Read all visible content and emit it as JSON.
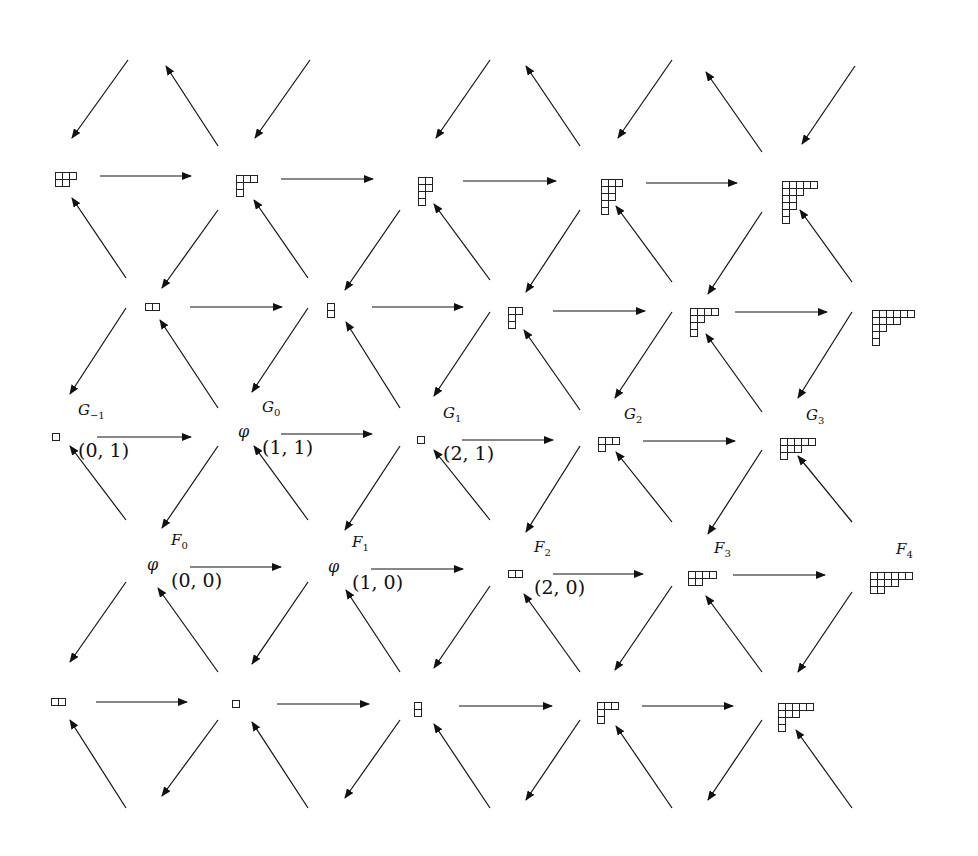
{
  "diagram": {
    "type": "young-diagram-lattice",
    "arrow_color": "#111111",
    "rows": [
      {
        "name": "row-1",
        "nodes": [
          {
            "x": 55,
            "y": 172,
            "partition": [
              3,
              2
            ]
          },
          {
            "x": 236,
            "y": 175,
            "partition": [
              3,
              1,
              1
            ]
          },
          {
            "x": 418,
            "y": 177,
            "partition": [
              2,
              2,
              1,
              1
            ]
          },
          {
            "x": 601,
            "y": 179,
            "partition": [
              3,
              2,
              2,
              1,
              1
            ]
          },
          {
            "x": 782,
            "y": 181,
            "partition": [
              5,
              3,
              2,
              2,
              1,
              1
            ]
          }
        ]
      },
      {
        "name": "row-2",
        "nodes": [
          {
            "x": 145,
            "y": 303,
            "partition": [
              2
            ]
          },
          {
            "x": 327,
            "y": 303,
            "partition": [
              1,
              1
            ]
          },
          {
            "x": 508,
            "y": 307,
            "partition": [
              2,
              1,
              1
            ]
          },
          {
            "x": 690,
            "y": 308,
            "partition": [
              4,
              2,
              1,
              1
            ]
          },
          {
            "x": 872,
            "y": 310,
            "partition": [
              6,
              4,
              2,
              1,
              1
            ]
          }
        ]
      },
      {
        "name": "row-G",
        "nodes": [
          {
            "x": 52,
            "y": 433,
            "partition": [
              1
            ],
            "label": "G",
            "sub": "−1",
            "coord": "(0, 1)"
          },
          {
            "x": 236,
            "y": 430,
            "partition": [],
            "label": "G",
            "sub": "0",
            "coord": "(1, 1)"
          },
          {
            "x": 417,
            "y": 436,
            "partition": [
              1
            ],
            "label": "G",
            "sub": "1",
            "coord": "(2, 1)"
          },
          {
            "x": 598,
            "y": 437,
            "partition": [
              3,
              1
            ],
            "label": "G",
            "sub": "2"
          },
          {
            "x": 780,
            "y": 438,
            "partition": [
              5,
              3,
              1
            ],
            "label": "G",
            "sub": "3"
          }
        ]
      },
      {
        "name": "row-F",
        "nodes": [
          {
            "x": 145,
            "y": 563,
            "partition": [],
            "label": "F",
            "sub": "0",
            "coord": "(0, 0)"
          },
          {
            "x": 326,
            "y": 565,
            "partition": [],
            "label": "F",
            "sub": "1",
            "coord": "(1, 0)"
          },
          {
            "x": 508,
            "y": 570,
            "partition": [
              2
            ],
            "label": "F",
            "sub": "2",
            "coord": "(2, 0)"
          },
          {
            "x": 688,
            "y": 571,
            "partition": [
              4,
              2
            ],
            "label": "F",
            "sub": "3"
          },
          {
            "x": 870,
            "y": 572,
            "partition": [
              6,
              4,
              2
            ],
            "label": "F",
            "sub": "4"
          }
        ]
      },
      {
        "name": "row-bottom",
        "nodes": [
          {
            "x": 51,
            "y": 698,
            "partition": [
              2
            ]
          },
          {
            "x": 232,
            "y": 700,
            "partition": [
              1
            ]
          },
          {
            "x": 414,
            "y": 702,
            "partition": [
              1,
              1
            ]
          },
          {
            "x": 597,
            "y": 702,
            "partition": [
              3,
              1,
              1
            ]
          },
          {
            "x": 778,
            "y": 703,
            "partition": [
              5,
              3,
              1,
              1
            ]
          }
        ]
      }
    ],
    "empty_symbol": "φ"
  }
}
